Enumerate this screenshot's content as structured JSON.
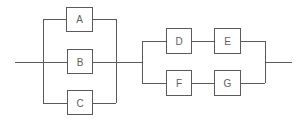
{
  "diagram": {
    "type": "reliability-block-diagram",
    "line_color": "#5a5a5a",
    "label_color": "#606060",
    "groups": [
      {
        "name": "parallel-group-1",
        "arrangement": "parallel",
        "blocks": [
          {
            "id": "A",
            "label": "A"
          },
          {
            "id": "B",
            "label": "B"
          },
          {
            "id": "C",
            "label": "C"
          }
        ]
      },
      {
        "name": "parallel-group-2",
        "arrangement": "parallel of series paths",
        "paths": [
          {
            "blocks": [
              {
                "id": "D",
                "label": "D"
              },
              {
                "id": "E",
                "label": "E"
              }
            ]
          },
          {
            "blocks": [
              {
                "id": "F",
                "label": "F"
              },
              {
                "id": "G",
                "label": "G"
              }
            ]
          }
        ]
      }
    ],
    "connection": "group-1 in series with group-2"
  }
}
